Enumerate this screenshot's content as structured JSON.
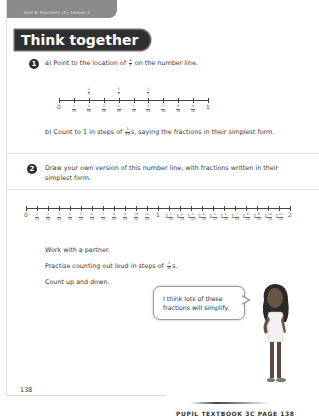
{
  "header": {
    "unit_label": "Unit 8: Fractions (1), Lesson 2",
    "section_title": "Think together"
  },
  "question1": {
    "number": "1",
    "part_a": {
      "label": "a)",
      "text_before": "Point to the location of",
      "fraction": {
        "num": "4",
        "den": "5"
      },
      "text_after": "on the number line."
    },
    "number_line": {
      "start_label": "0",
      "end_label": "1",
      "lower_labels": [
        {
          "num": "1",
          "den": "10"
        },
        {
          "num": "2",
          "den": "10"
        },
        {
          "num": "3",
          "den": "10"
        },
        {
          "num": "4",
          "den": "10"
        },
        {
          "num": "5",
          "den": "10"
        },
        {
          "num": "6",
          "den": "10"
        },
        {
          "num": "7",
          "den": "10"
        },
        {
          "num": "8",
          "den": "10"
        },
        {
          "num": "9",
          "den": "10"
        }
      ],
      "upper_labels": [
        {
          "position": 2,
          "num": "1",
          "den": "5"
        },
        {
          "position": 4,
          "num": "2",
          "den": "5"
        },
        {
          "position": 6,
          "num": "3",
          "den": "5"
        }
      ]
    },
    "part_b": {
      "label": "b)",
      "text_before": "Count to 1 in steps of",
      "fraction": {
        "num": "1",
        "den": "10"
      },
      "text_after": "s, saying the fractions in their simplest form."
    }
  },
  "question2": {
    "number": "2",
    "line1": "Draw your own version of this number line, with fractions written in their",
    "line2": "simplest form.",
    "number_line": {
      "start_label": "0",
      "mid_label": "1",
      "end_label": "2",
      "first_half": [
        {
          "num": "1",
          "den": "12"
        },
        {
          "num": "2",
          "den": "12"
        },
        {
          "num": "3",
          "den": "12"
        },
        {
          "num": "4",
          "den": "12"
        },
        {
          "num": "5",
          "den": "12"
        },
        {
          "num": "6",
          "den": "12"
        },
        {
          "num": "7",
          "den": "12"
        },
        {
          "num": "8",
          "den": "12"
        },
        {
          "num": "9",
          "den": "12"
        },
        {
          "num": "10",
          "den": "12"
        },
        {
          "num": "11",
          "den": "12"
        }
      ],
      "second_half": [
        {
          "whole": "1",
          "num": "1",
          "den": "12"
        },
        {
          "whole": "1",
          "num": "2",
          "den": "12"
        },
        {
          "whole": "1",
          "num": "3",
          "den": "12"
        },
        {
          "whole": "1",
          "num": "4",
          "den": "12"
        },
        {
          "whole": "1",
          "num": "5",
          "den": "12"
        },
        {
          "whole": "1",
          "num": "6",
          "den": "12"
        },
        {
          "whole": "1",
          "num": "7",
          "den": "12"
        },
        {
          "whole": "1",
          "num": "8",
          "den": "12"
        },
        {
          "whole": "1",
          "num": "9",
          "den": "12"
        },
        {
          "whole": "1",
          "num": "10",
          "den": "12"
        },
        {
          "whole": "1",
          "num": "11",
          "den": "12"
        }
      ]
    },
    "instructions": {
      "line1": "Work with a partner.",
      "line2_before": "Practise counting out loud in steps of",
      "line2_fraction": {
        "num": "1",
        "den": "12"
      },
      "line2_after": "s.",
      "line3": "Count up and down."
    }
  },
  "speech_bubble": {
    "line1": "I think lots of these",
    "line2": "fractions will simplify."
  },
  "footer": {
    "page_number": "138",
    "next_page_text": "PUPIL TEXTBOOK 3C  PAGE 138"
  },
  "colors": {
    "banner_bg": "#2f2f2f",
    "unit_band": "#8a8a8a",
    "question_circle": "#2d2d2d"
  }
}
